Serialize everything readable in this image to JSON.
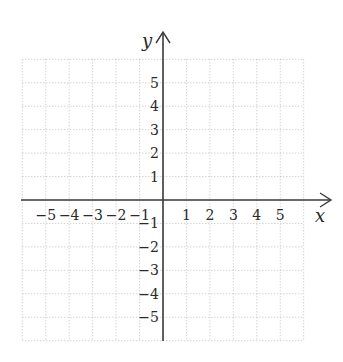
{
  "chart_data": {
    "type": "scatter",
    "title": "",
    "xlabel": "x",
    "ylabel": "y",
    "xlim": [
      -6,
      6
    ],
    "ylim": [
      -6,
      6
    ],
    "grid": true,
    "grid_style": "dotted",
    "x_ticks": [
      "-5",
      "-4",
      "-3",
      "-2",
      "-1",
      "1",
      "2",
      "3",
      "4",
      "5"
    ],
    "y_ticks": [
      "5",
      "4",
      "3",
      "2",
      "1",
      "-1",
      "-2",
      "-3",
      "-4",
      "-5"
    ],
    "series": []
  },
  "colors": {
    "axis": "#3a3a3a",
    "grid": "#b0b0b0",
    "text": "#2a2a2a"
  }
}
